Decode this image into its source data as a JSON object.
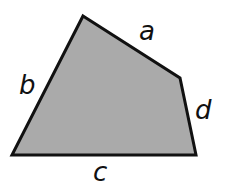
{
  "diagram": {
    "type": "quadrilateral",
    "fill_color": "#aaaaaa",
    "stroke_color": "#111111",
    "vertices": [
      {
        "x": 83,
        "y": 16
      },
      {
        "x": 180,
        "y": 78
      },
      {
        "x": 196,
        "y": 155
      },
      {
        "x": 12,
        "y": 155
      }
    ],
    "labels": {
      "a": {
        "text": "a",
        "x": 139,
        "y": 40
      },
      "b": {
        "text": "b",
        "x": 19,
        "y": 94
      },
      "c": {
        "text": "c",
        "x": 93,
        "y": 181
      },
      "d": {
        "text": "d",
        "x": 195,
        "y": 119
      }
    }
  }
}
